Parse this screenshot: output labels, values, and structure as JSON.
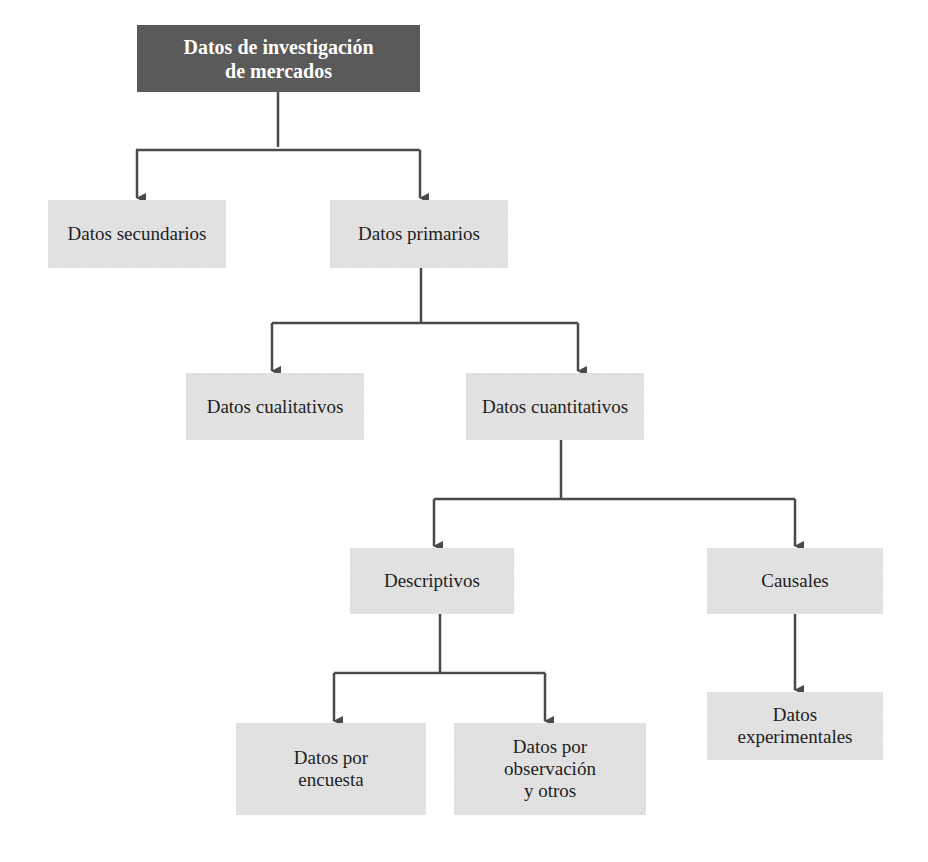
{
  "diagram": {
    "type": "tree",
    "colors": {
      "root_fill": "#5a5a5a",
      "node_fill": "#e2e2e2",
      "connector": "#4a4a4a",
      "root_text": "#ffffff",
      "node_text": "#1e1e1e"
    },
    "nodes": {
      "root": "Datos de investigación\nde mercados",
      "secundarios": "Datos secundarios",
      "primarios": "Datos primarios",
      "cualitativos": "Datos cualitativos",
      "cuantitativos": "Datos cuantitativos",
      "descriptivos": "Descriptivos",
      "causales": "Causales",
      "encuesta": "Datos por\nencuesta",
      "observacion": "Datos por\nobservación\ny otros",
      "experimentales": "Datos\nexperimentales"
    },
    "edges": [
      {
        "from": "root",
        "to": "secundarios"
      },
      {
        "from": "root",
        "to": "primarios"
      },
      {
        "from": "primarios",
        "to": "cualitativos"
      },
      {
        "from": "primarios",
        "to": "cuantitativos"
      },
      {
        "from": "cuantitativos",
        "to": "descriptivos"
      },
      {
        "from": "cuantitativos",
        "to": "causales"
      },
      {
        "from": "descriptivos",
        "to": "encuesta"
      },
      {
        "from": "descriptivos",
        "to": "observacion"
      },
      {
        "from": "causales",
        "to": "experimentales"
      }
    ]
  }
}
